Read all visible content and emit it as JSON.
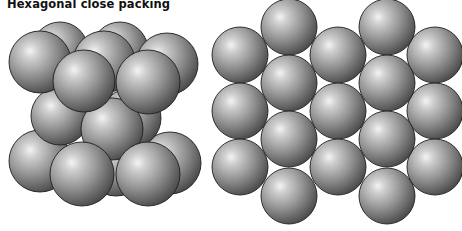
{
  "figure": {
    "title": "Hexagonal close packing",
    "colors": {
      "background": "#ffffff",
      "sphere_highlight": "#f2f2f2",
      "sphere_mid": "#9c9c9c",
      "sphere_shadow": "#4a4a4a",
      "sphere_outline": "#1e1e1e"
    },
    "views": [
      {
        "name": "side-perspective-view",
        "description": "Three stacked layers (ABA) of spheres viewed in perspective",
        "sphere_count": 15
      },
      {
        "name": "top-down-view",
        "description": "Hexagonal arrangement of spheres seen from above",
        "sphere_count": 18
      }
    ]
  }
}
